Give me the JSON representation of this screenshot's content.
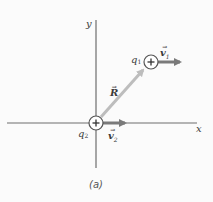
{
  "diagram": {
    "caption": "(a)",
    "axes": {
      "x_label": "x",
      "y_label": "y"
    },
    "charges": [
      {
        "id": "q1",
        "label": "q",
        "subscript": "1",
        "sign": "+",
        "velocity_label": "v",
        "velocity_subscript": "1"
      },
      {
        "id": "q2",
        "label": "q",
        "subscript": "2",
        "sign": "+",
        "velocity_label": "v",
        "velocity_subscript": "2"
      }
    ],
    "separation_vector": {
      "label": "R",
      "from": "q2",
      "to": "q1"
    },
    "colors": {
      "axis": "#6e6e6e",
      "velocity_arrow": "#7a7a7a",
      "separation_arrow": "#bdbdbd",
      "charge_outline": "#555555",
      "background": "#fbfbfb"
    }
  }
}
